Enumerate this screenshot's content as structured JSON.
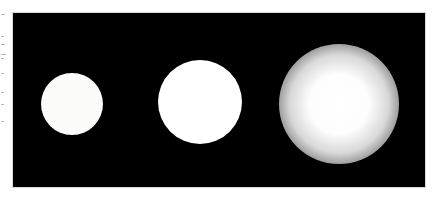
{
  "image": {
    "description": "Three white circular spots on a black background, increasing in size and blur from left to right",
    "background_color": "#000000",
    "spots": [
      {
        "label": "sharp",
        "cx": 59,
        "cy": 91,
        "r": 31,
        "blur": "none"
      },
      {
        "label": "slightly-blurred",
        "cx": 187,
        "cy": 89,
        "r": 41,
        "blur": "low"
      },
      {
        "label": "heavily-blurred",
        "cx": 326,
        "cy": 91,
        "r": 57,
        "blur": "high"
      }
    ]
  }
}
